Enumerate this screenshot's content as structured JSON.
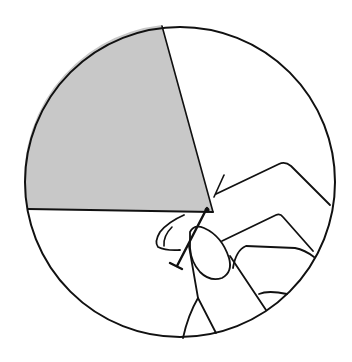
{
  "figure": {
    "circle": {
      "cx": 180,
      "cy": 182,
      "r": 155
    },
    "sector": {
      "vertex": [
        213,
        212
      ],
      "edge_top": [
        162,
        25
      ],
      "edge_left": [
        27,
        209
      ],
      "fill_color": "#c8c8c8"
    },
    "stroke_color": "#111111",
    "background_color": "#ffffff",
    "elements": [
      "circle-outline",
      "shaded-sector",
      "hand",
      "pin",
      "pointer-arrow"
    ]
  }
}
